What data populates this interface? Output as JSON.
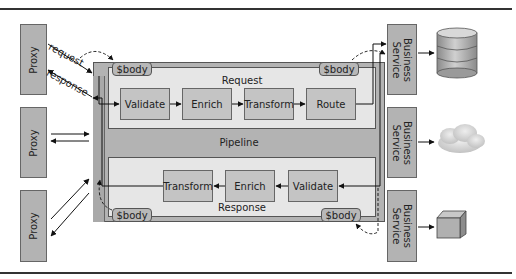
{
  "proxies": [
    {
      "label": "Proxy"
    },
    {
      "label": "Proxy"
    },
    {
      "label": "Proxy"
    }
  ],
  "arrows": {
    "request_label": "request",
    "response_label": "response"
  },
  "pipeline": {
    "label": "Pipeline",
    "request_lane": {
      "label": "Request",
      "body_left": "$body",
      "body_right": "$body",
      "stages": [
        "Validate",
        "Enrich",
        "Transform",
        "Route"
      ]
    },
    "response_lane": {
      "label": "Response",
      "body_left": "$body",
      "body_right": "$body",
      "stages": [
        "Transform",
        "Enrich",
        "Validate"
      ]
    }
  },
  "services": [
    {
      "line1": "Business",
      "line2": "Service",
      "target": "database-icon"
    },
    {
      "line1": "Business",
      "line2": "Service",
      "target": "cloud-icon"
    },
    {
      "line1": "Business",
      "line2": "Service",
      "target": "cube-icon"
    }
  ],
  "colors": {
    "box_fill": "#b3b3b3",
    "lane_fill": "#e6e6e6",
    "stage_fill": "#c4c4c4",
    "border": "#555555"
  }
}
